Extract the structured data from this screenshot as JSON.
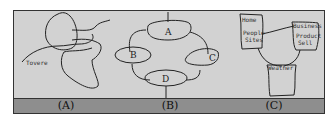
{
  "panels": [
    {
      "id": "A",
      "label": "(A)",
      "annotation": "Tovere"
    },
    {
      "id": "B",
      "label": "(B)",
      "nodes": [
        "A",
        "B",
        "C",
        "D"
      ]
    },
    {
      "id": "C",
      "label": "(C)",
      "boxes": [
        {
          "title": "Home",
          "lines": [
            "People",
            "Sites"
          ]
        },
        {
          "title": "Business",
          "lines": [
            "Product",
            "Sell"
          ]
        },
        {
          "title": "Weather",
          "lines": []
        }
      ]
    }
  ]
}
